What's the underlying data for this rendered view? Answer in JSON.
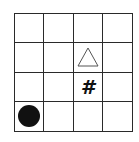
{
  "board": {
    "rows": 4,
    "cols": 4,
    "line_color": "#2a2a2a",
    "pieces": [
      {
        "type": "triangle",
        "row": 1,
        "col": 2,
        "label": "△",
        "fill": "#ffffff",
        "stroke": "#555555"
      },
      {
        "type": "hash",
        "row": 2,
        "col": 2,
        "label": "#",
        "color": "#111111"
      },
      {
        "type": "circle",
        "row": 3,
        "col": 0,
        "label": "●",
        "color": "#111111"
      }
    ]
  }
}
